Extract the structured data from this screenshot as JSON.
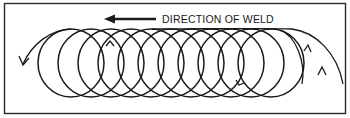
{
  "diagram": {
    "title": "DIRECTION OF WELD",
    "direction_arrow": "left",
    "pattern": "circular weave",
    "circle_count": 12,
    "colors": {
      "stroke": "#1a1a1a",
      "background": "#ffffff",
      "border": "#2a2a2a"
    }
  }
}
